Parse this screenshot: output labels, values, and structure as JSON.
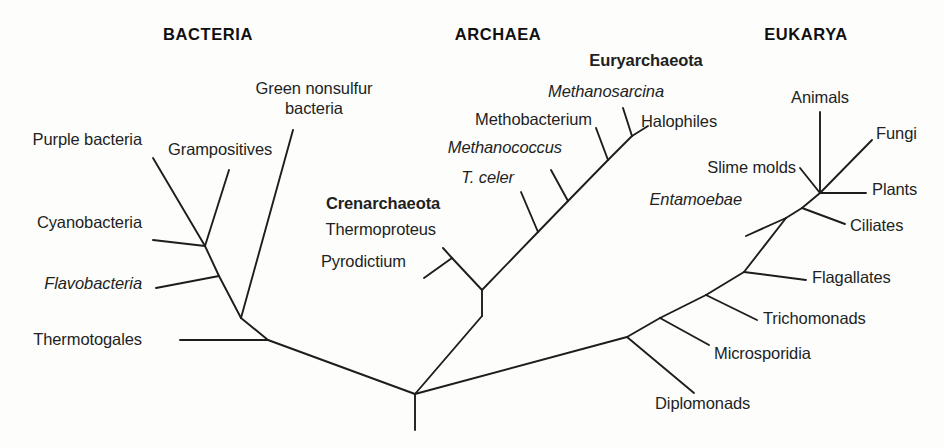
{
  "figure": {
    "kind": "phylogenetic-tree",
    "background_color": "#fdfdfc",
    "line_color": "#1d1d1d",
    "text_color": "#221f1f"
  },
  "domains": [
    {
      "id": "bacteria",
      "label": "BACTERIA"
    },
    {
      "id": "archaea",
      "label": "ARCHAEA"
    },
    {
      "id": "eukarya",
      "label": "EUKARYA"
    }
  ],
  "groups": [
    {
      "id": "crenarchaeota",
      "label": "Crenarchaeota"
    },
    {
      "id": "euryarchaeota",
      "label": "Euryarchaeota"
    }
  ],
  "taxa": {
    "bacteria": [
      {
        "id": "purple-bacteria",
        "label": "Purple bacteria"
      },
      {
        "id": "cyanobacteria",
        "label": "Cyanobacteria"
      },
      {
        "id": "flavobacteria",
        "label": "Flavobacteria"
      },
      {
        "id": "thermotogales",
        "label": "Thermotogales"
      },
      {
        "id": "grampositives",
        "label": "Grampositives"
      },
      {
        "id": "green-nonsulfur-line1",
        "label": "Green nonsulfur"
      },
      {
        "id": "green-nonsulfur-line2",
        "label": "bacteria"
      }
    ],
    "archaea": [
      {
        "id": "pyrodictium",
        "label": "Pyrodictium"
      },
      {
        "id": "thermoproteus",
        "label": "Thermoproteus"
      },
      {
        "id": "t-celer",
        "label": "T. celer"
      },
      {
        "id": "methanococcus",
        "label": "Methanococcus"
      },
      {
        "id": "methobacterium",
        "label": "Methobacterium"
      },
      {
        "id": "methanosarcina",
        "label": "Methanosarcina"
      },
      {
        "id": "halophiles",
        "label": "Halophiles"
      }
    ],
    "eukarya": [
      {
        "id": "entamoebae",
        "label": "Entamoebae"
      },
      {
        "id": "slime-molds",
        "label": "Slime molds"
      },
      {
        "id": "animals",
        "label": "Animals"
      },
      {
        "id": "fungi",
        "label": "Fungi"
      },
      {
        "id": "plants",
        "label": "Plants"
      },
      {
        "id": "ciliates",
        "label": "Ciliates"
      },
      {
        "id": "flagallates",
        "label": "Flagallates"
      },
      {
        "id": "trichomonads",
        "label": "Trichomonads"
      },
      {
        "id": "microsporidia",
        "label": "Microsporidia"
      },
      {
        "id": "diplomonads",
        "label": "Diplomonads"
      }
    ]
  },
  "chart_data": {
    "type": "tree",
    "title": "",
    "branches": [
      {
        "from": "root",
        "to": "bacteria-stem",
        "x1": 415,
        "y1": 430,
        "x2": 415,
        "y2": 394
      },
      {
        "from": "root-node",
        "to": "bacteria-base",
        "x1": 415,
        "y1": 394,
        "x2": 268,
        "y2": 340
      },
      {
        "from": "root-node",
        "to": "eukarya-base",
        "x1": 415,
        "y1": 394,
        "x2": 627,
        "y2": 337
      },
      {
        "from": "root-node",
        "to": "archaea-base",
        "x1": 415,
        "y1": 394,
        "x2": 482,
        "y2": 316
      },
      {
        "from": "bacteria-base",
        "to": "thermotogales-tip",
        "x1": 268,
        "y1": 340,
        "x2": 180,
        "y2": 340
      },
      {
        "from": "bacteria-base",
        "to": "bacteria-node2",
        "x1": 268,
        "y1": 340,
        "x2": 241,
        "y2": 318
      },
      {
        "from": "bacteria-node2",
        "to": "green-nonsulfur-tip",
        "x1": 241,
        "y1": 318,
        "x2": 293,
        "y2": 130
      },
      {
        "from": "bacteria-node2",
        "to": "bacteria-node3",
        "x1": 241,
        "y1": 318,
        "x2": 219,
        "y2": 276
      },
      {
        "from": "bacteria-node3",
        "to": "flavobacteria-tip",
        "x1": 219,
        "y1": 276,
        "x2": 156,
        "y2": 288
      },
      {
        "from": "bacteria-node3",
        "to": "bacteria-node4",
        "x1": 219,
        "y1": 276,
        "x2": 205,
        "y2": 246
      },
      {
        "from": "bacteria-node4",
        "to": "cyanobacteria-tip",
        "x1": 205,
        "y1": 246,
        "x2": 153,
        "y2": 240
      },
      {
        "from": "bacteria-node4",
        "to": "grampositives-tip",
        "x1": 205,
        "y1": 246,
        "x2": 229,
        "y2": 170
      },
      {
        "from": "bacteria-node4",
        "to": "purple-bacteria-tip",
        "x1": 205,
        "y1": 246,
        "x2": 153,
        "y2": 158
      },
      {
        "from": "archaea-base",
        "to": "archaea-node",
        "x1": 482,
        "y1": 316,
        "x2": 482,
        "y2": 290
      },
      {
        "from": "archaea-node",
        "to": "crenarch-node",
        "x1": 482,
        "y1": 290,
        "x2": 452,
        "y2": 258
      },
      {
        "from": "crenarch-node",
        "to": "pyrodictium-tip",
        "x1": 452,
        "y1": 258,
        "x2": 424,
        "y2": 278
      },
      {
        "from": "crenarch-node",
        "to": "thermoproteus-tip",
        "x1": 452,
        "y1": 258,
        "x2": 443,
        "y2": 248
      },
      {
        "from": "archaea-node",
        "to": "eury-node1",
        "x1": 482,
        "y1": 290,
        "x2": 538,
        "y2": 232
      },
      {
        "from": "eury-node1",
        "to": "t-celer-tip",
        "x1": 538,
        "y1": 232,
        "x2": 521,
        "y2": 192
      },
      {
        "from": "eury-node1",
        "to": "eury-node2",
        "x1": 538,
        "y1": 232,
        "x2": 568,
        "y2": 201
      },
      {
        "from": "eury-node2",
        "to": "methanococcus-tip",
        "x1": 568,
        "y1": 201,
        "x2": 551,
        "y2": 170
      },
      {
        "from": "eury-node2",
        "to": "eury-node3",
        "x1": 568,
        "y1": 201,
        "x2": 608,
        "y2": 160
      },
      {
        "from": "eury-node3",
        "to": "methobacterium-tip",
        "x1": 608,
        "y1": 160,
        "x2": 596,
        "y2": 128
      },
      {
        "from": "eury-node3",
        "to": "eury-node4",
        "x1": 608,
        "y1": 160,
        "x2": 632,
        "y2": 136
      },
      {
        "from": "eury-node4",
        "to": "methanosarcina-tip",
        "x1": 632,
        "y1": 136,
        "x2": 623,
        "y2": 108
      },
      {
        "from": "eury-node4",
        "to": "halophiles-tip",
        "x1": 632,
        "y1": 136,
        "x2": 648,
        "y2": 126
      },
      {
        "from": "eukarya-base",
        "to": "diplomonads-tip",
        "x1": 627,
        "y1": 337,
        "x2": 694,
        "y2": 393
      },
      {
        "from": "eukarya-base",
        "to": "euk-node2",
        "x1": 627,
        "y1": 337,
        "x2": 660,
        "y2": 318
      },
      {
        "from": "euk-node2",
        "to": "microsporidia-tip",
        "x1": 660,
        "y1": 318,
        "x2": 709,
        "y2": 345
      },
      {
        "from": "euk-node2",
        "to": "euk-node3",
        "x1": 660,
        "y1": 318,
        "x2": 706,
        "y2": 295
      },
      {
        "from": "euk-node3",
        "to": "trichomonads-tip",
        "x1": 706,
        "y1": 295,
        "x2": 757,
        "y2": 320
      },
      {
        "from": "euk-node3",
        "to": "euk-node4",
        "x1": 706,
        "y1": 295,
        "x2": 744,
        "y2": 272
      },
      {
        "from": "euk-node4",
        "to": "flagallates-tip",
        "x1": 744,
        "y1": 272,
        "x2": 806,
        "y2": 280
      },
      {
        "from": "euk-node4",
        "to": "euk-node5",
        "x1": 744,
        "y1": 272,
        "x2": 786,
        "y2": 218
      },
      {
        "from": "euk-node5",
        "to": "entamoebae-tip",
        "x1": 786,
        "y1": 218,
        "x2": 746,
        "y2": 236
      },
      {
        "from": "euk-node5",
        "to": "euk-node6",
        "x1": 786,
        "y1": 218,
        "x2": 802,
        "y2": 208
      },
      {
        "from": "euk-node6",
        "to": "ciliates-tip",
        "x1": 802,
        "y1": 208,
        "x2": 845,
        "y2": 224
      },
      {
        "from": "euk-node6",
        "to": "euk-node7",
        "x1": 802,
        "y1": 208,
        "x2": 820,
        "y2": 193
      },
      {
        "from": "euk-node7",
        "to": "slime-molds-tip",
        "x1": 820,
        "y1": 193,
        "x2": 800,
        "y2": 168
      },
      {
        "from": "euk-node7",
        "to": "plants-tip",
        "x1": 820,
        "y1": 193,
        "x2": 866,
        "y2": 193
      },
      {
        "from": "euk-node7",
        "to": "animals-tip",
        "x1": 820,
        "y1": 193,
        "x2": 820,
        "y2": 112
      },
      {
        "from": "euk-node7",
        "to": "fungi-tip",
        "x1": 820,
        "y1": 193,
        "x2": 872,
        "y2": 140
      }
    ]
  }
}
